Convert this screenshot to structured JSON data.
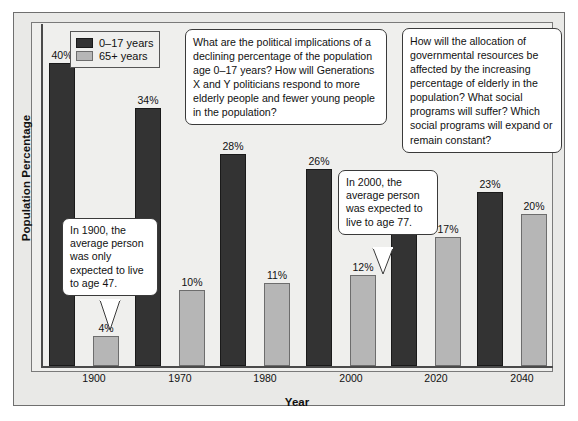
{
  "chart_data": {
    "type": "bar",
    "title": "",
    "xlabel": "Year",
    "ylabel": "Population Percentage",
    "categories": [
      "1900",
      "1970",
      "1980",
      "2000",
      "2020",
      "2040"
    ],
    "ylim": [
      0,
      40
    ],
    "grid": false,
    "legend_position": "top-left",
    "series": [
      {
        "name": "0–17 years",
        "color": "#333333",
        "values": [
          40,
          34,
          28,
          26,
          24,
          23
        ],
        "value_labels": [
          "40%",
          "34%",
          "28%",
          "26%",
          "24%",
          "23%"
        ]
      },
      {
        "name": "65+ years",
        "color": "#b6b6b6",
        "values": [
          4,
          10,
          11,
          12,
          17,
          20
        ],
        "value_labels": [
          "4%",
          "10%",
          "11%",
          "12%",
          "17%",
          "20%"
        ]
      }
    ],
    "annotations": [
      {
        "id": "note-1900",
        "text": "In 1900, the average person was only expected to live to age 47."
      },
      {
        "id": "note-2000",
        "text": "In 2000, the average person was expected to live to age 77."
      },
      {
        "id": "question-left",
        "text": "What are the political implications of a declining percentage of the population age 0–17 years? How will Generations X and Y politicians respond to more elderly people and fewer young people in the population?"
      },
      {
        "id": "question-right",
        "text": "How will the allocation of governmental resources be affected by the increasing percentage of elderly in the population? What social programs will suffer? Which social programs will expand or remain constant?"
      }
    ]
  },
  "legend": {
    "items": [
      {
        "label": "0–17 years",
        "color": "#333333"
      },
      {
        "label": "65+ years",
        "color": "#b6b6b6"
      }
    ]
  },
  "axes": {
    "x_title": "Year",
    "y_title": "Population Percentage",
    "x_ticks": [
      "1900",
      "1970",
      "1980",
      "2000",
      "2020",
      "2040"
    ]
  },
  "callouts": {
    "note_1900": "In 1900, the average person was only expected to live to age 47.",
    "note_2000": "In 2000, the average person was expected to live to age 77.",
    "question_left": "What are the political implications of a declining percentage of the population age 0–17 years? How will Generations X and Y politicians respond to more elderly people and fewer young people in the population?",
    "question_right": "How will the allocation of governmental resources be affected by the increasing percentage of elderly in the population? What social programs will suffer? Which social programs will expand or remain constant?"
  },
  "colors": {
    "series_young": "#333333",
    "series_old": "#b6b6b6",
    "plot_background": "#efefed",
    "frame_background": "#e9e9e7",
    "axis": "#4a4a4a"
  }
}
